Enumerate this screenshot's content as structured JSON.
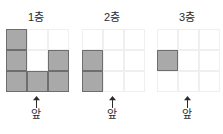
{
  "background_color": "#ffffff",
  "fill_color": "#a9a9a9",
  "fill_border_color": "#6e6e6e",
  "grid_line_color": "#efefef",
  "text_color": "#2b2b2b",
  "front_label": "앞",
  "arrow_icon": "up-arrow-icon",
  "panels": [
    {
      "title": "1층",
      "rows": 3,
      "cols": 3,
      "filled": [
        [
          1,
          0,
          0
        ],
        [
          1,
          0,
          1
        ],
        [
          1,
          1,
          1
        ]
      ],
      "filled_count": 6,
      "front_label": "앞"
    },
    {
      "title": "2층",
      "rows": 3,
      "cols": 3,
      "filled": [
        [
          0,
          0,
          0
        ],
        [
          1,
          0,
          0
        ],
        [
          1,
          0,
          0
        ]
      ],
      "filled_count": 2,
      "front_label": "앞"
    },
    {
      "title": "3층",
      "rows": 3,
      "cols": 3,
      "filled": [
        [
          0,
          0,
          0
        ],
        [
          1,
          0,
          0
        ],
        [
          0,
          0,
          0
        ]
      ],
      "filled_count": 1,
      "front_label": "앞"
    }
  ]
}
